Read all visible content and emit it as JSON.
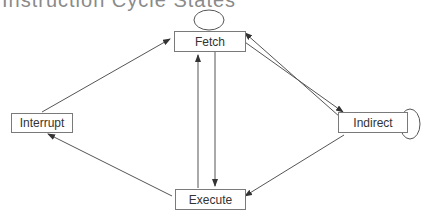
{
  "title": "Instruction Cycle States",
  "nodes": {
    "fetch": {
      "label": "Fetch"
    },
    "indirect": {
      "label": "Indirect"
    },
    "execute": {
      "label": "Execute"
    },
    "interrupt": {
      "label": "Interrupt"
    }
  },
  "edges": [
    {
      "from": "Fetch",
      "to": "Fetch"
    },
    {
      "from": "Fetch",
      "to": "Indirect"
    },
    {
      "from": "Indirect",
      "to": "Fetch"
    },
    {
      "from": "Indirect",
      "to": "Indirect"
    },
    {
      "from": "Fetch",
      "to": "Execute"
    },
    {
      "from": "Execute",
      "to": "Fetch"
    },
    {
      "from": "Indirect",
      "to": "Execute"
    },
    {
      "from": "Execute",
      "to": "Interrupt"
    },
    {
      "from": "Interrupt",
      "to": "Fetch"
    }
  ],
  "colors": {
    "line": "#555555",
    "border": "#7a7a7a",
    "text": "#333333"
  }
}
